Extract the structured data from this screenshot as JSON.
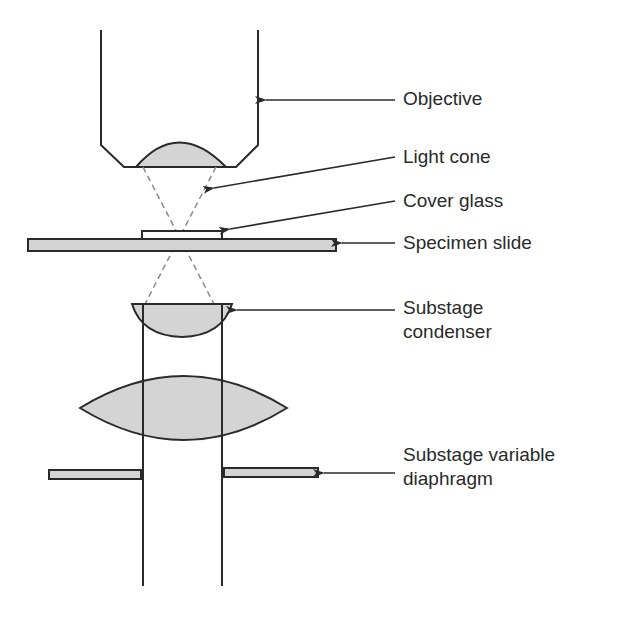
{
  "colors": {
    "stroke": "#2a2a2a",
    "lens_fill": "#d4d4d4",
    "dashed_ray": "#8a8a8a",
    "background": "#ffffff"
  },
  "labels": {
    "objective": "Objective",
    "light_cone": "Light cone",
    "cover_glass": "Cover glass",
    "specimen_slide": "Specimen slide",
    "substage_condenser_line1": "Substage",
    "substage_condenser_line2": "condenser",
    "diaphragm_line1": "Substage variable",
    "diaphragm_line2": "diaphragm"
  }
}
